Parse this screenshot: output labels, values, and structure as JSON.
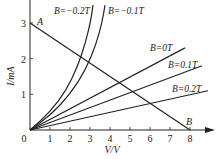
{
  "chart_data": {
    "type": "line",
    "title": "",
    "xlabel": "V/V",
    "ylabel": "I/mA",
    "xlim": [
      0,
      9
    ],
    "ylim": [
      0,
      3.6
    ],
    "x_ticks": [
      "1",
      "2",
      "3",
      "4",
      "5",
      "6",
      "7",
      "8"
    ],
    "y_ticks": [
      "1",
      "2",
      "3"
    ],
    "origin_label": "0",
    "grid": false,
    "series": [
      {
        "name": "B=−0.2T",
        "kind": "curve",
        "points": [
          [
            0,
            0
          ],
          [
            1,
            0.5
          ],
          [
            1.8,
            1.1
          ],
          [
            2.4,
            1.8
          ],
          [
            2.8,
            2.5
          ],
          [
            3.05,
            3.1
          ],
          [
            3.15,
            3.5
          ]
        ]
      },
      {
        "name": "B=−0.1T",
        "kind": "curve",
        "points": [
          [
            0,
            0
          ],
          [
            1,
            0.4
          ],
          [
            2,
            1.0
          ],
          [
            2.8,
            1.7
          ],
          [
            3.3,
            2.4
          ],
          [
            3.6,
            3.0
          ],
          [
            3.75,
            3.5
          ]
        ]
      },
      {
        "name": "B=0T",
        "kind": "line",
        "points": [
          [
            0,
            0
          ],
          [
            7.75,
            2.3
          ]
        ]
      },
      {
        "name": "B=0.1T",
        "kind": "line",
        "points": [
          [
            0,
            0
          ],
          [
            8.6,
            1.8
          ]
        ]
      },
      {
        "name": "B=0.2T",
        "kind": "line",
        "points": [
          [
            0,
            0
          ],
          [
            8.9,
            1.1
          ]
        ]
      },
      {
        "name": "load-line",
        "kind": "line",
        "points": [
          [
            0,
            3
          ],
          [
            8,
            0
          ]
        ]
      }
    ],
    "annotations": [
      {
        "text": "A",
        "x": 0,
        "y": 3
      },
      {
        "text": "B",
        "x": 8,
        "y": 0
      }
    ]
  }
}
